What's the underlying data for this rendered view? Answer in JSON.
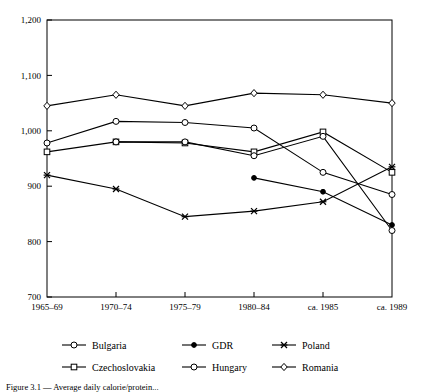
{
  "chart_data": {
    "type": "line",
    "title": "",
    "subtitle": "",
    "xlabel": "",
    "ylabel": "",
    "grid": false,
    "legend_position": "bottom",
    "categories": [
      "1965–69",
      "1970–74",
      "1975–79",
      "1980–84",
      "ca. 1985",
      "ca. 1989"
    ],
    "ylim": [
      700,
      1200
    ],
    "ytick_labels": [
      "700",
      "800",
      "900",
      "1,000",
      "1,100",
      "1,200"
    ],
    "ytick_values": [
      700,
      800,
      900,
      1000,
      1100,
      1200
    ],
    "series": [
      {
        "name": "Bulgaria",
        "marker": "open-circle",
        "values": [
          978,
          1017,
          1015,
          1005,
          925,
          885
        ]
      },
      {
        "name": "GDR",
        "marker": "filled-circle",
        "values": [
          null,
          null,
          null,
          915,
          890,
          830
        ]
      },
      {
        "name": "Poland",
        "marker": "cross-x",
        "values": [
          920,
          895,
          845,
          855,
          872,
          935
        ]
      },
      {
        "name": "Czechoslovakia",
        "marker": "open-square",
        "values": [
          962,
          980,
          978,
          962,
          998,
          925
        ]
      },
      {
        "name": "Hungary",
        "marker": "open-circle",
        "values": [
          null,
          980,
          980,
          955,
          990,
          820
        ]
      },
      {
        "name": "Romania",
        "marker": "open-diamond",
        "values": [
          1045,
          1065,
          1045,
          1068,
          1065,
          1050
        ]
      }
    ]
  },
  "legend": {
    "row1": [
      "Bulgaria",
      "GDR",
      "Poland"
    ],
    "row2": [
      "Czechoslovakia",
      "Hungary",
      "Romania"
    ]
  },
  "caption": {
    "text": "Figure 3.1 — Average daily calorie/protein...",
    "visible": "partially-cropped"
  },
  "colors": {
    "line": "#000000",
    "axis": "#000000",
    "background": "#ffffff",
    "marker_fill": "#ffffff"
  }
}
